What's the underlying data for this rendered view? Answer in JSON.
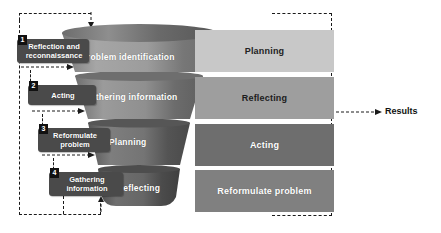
{
  "diagram": {
    "title_visible": false,
    "background_color": "#ffffff",
    "funnel": {
      "name": "action-research-funnel",
      "segments": [
        {
          "label": "Problem identification",
          "color_top": "#9a9a9a",
          "color_bottom": "#8f8f8f"
        },
        {
          "label": "Gathering information",
          "color_top": "#8d8d8d",
          "color_bottom": "#858585"
        },
        {
          "label": "Planning",
          "color_top": "#6f6f6f",
          "color_bottom": "#6a6a6a"
        },
        {
          "label": "Reflecting",
          "color_top": "#5f5f5f",
          "color_bottom": "#585858"
        }
      ]
    },
    "bars": [
      {
        "label": "Planning",
        "color": "#c8c8c8"
      },
      {
        "label": "Reflecting",
        "color": "#9e9e9e"
      },
      {
        "label": "Acting",
        "color": "#6e6e6e"
      },
      {
        "label": "Reformulate problem",
        "color": "#808080"
      }
    ],
    "steps": [
      {
        "number": "1",
        "label": "Reflection and reconnaissance"
      },
      {
        "number": "2",
        "label": "Acting"
      },
      {
        "number": "3",
        "label": "Reformulate problem"
      },
      {
        "number": "4",
        "label": "Gathering information"
      }
    ],
    "outcome": {
      "label": "Results",
      "arrow": "arrow-right"
    },
    "colors": {
      "step_box": "#4a4a4a",
      "badge": "#111111",
      "dash_line": "#1a1a1a",
      "text_light": "#ffffff",
      "text_dark": "#111111"
    }
  }
}
